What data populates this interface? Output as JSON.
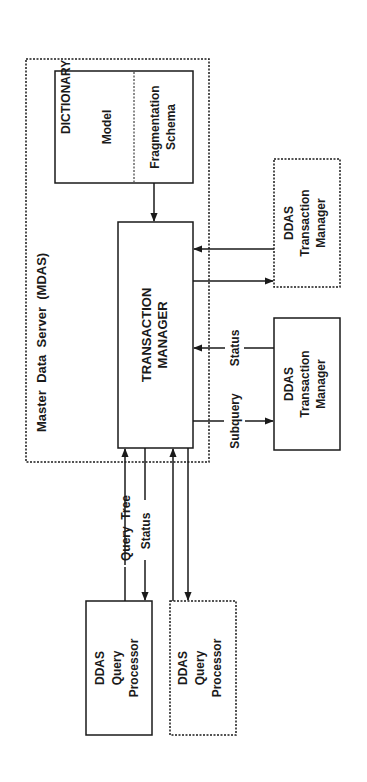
{
  "diagram": {
    "orientation": "rotated-90-ccw",
    "mdas": {
      "title": "Master  Data  Server  (MDAS)",
      "style": "dashed"
    },
    "dictionary": {
      "title": "DICTIONARY",
      "sections": [
        "Model",
        "Fragmentation",
        "Schema"
      ]
    },
    "transaction_manager": {
      "line1": "TRANSACTION",
      "line2": "MANAGER"
    },
    "ddas_tm_upper": {
      "lines": [
        "DDAS",
        "Transaction",
        "Manager"
      ],
      "style": "dashed"
    },
    "ddas_tm_lower": {
      "lines": [
        "DDAS",
        "Transaction",
        "Manager"
      ],
      "style": "solid"
    },
    "qp_left": {
      "lines": [
        "DDAS",
        "Query",
        "Processor"
      ],
      "style": "solid"
    },
    "qp_right": {
      "lines": [
        "DDAS",
        "Query",
        "Processor"
      ],
      "style": "dashed"
    },
    "edge_labels": {
      "subquery": "Subquery",
      "status_tm": "Status",
      "query_tree": "Query  Tree",
      "status_qp": "Status"
    },
    "colors": {
      "ink": "#1a1a1a",
      "background": "#ffffff"
    }
  }
}
